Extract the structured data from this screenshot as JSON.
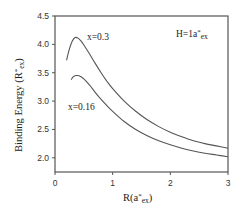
{
  "chart_data": {
    "type": "line",
    "title": "",
    "xlabel": {
      "base": "R(a",
      "sup": "*",
      "sub": "ex",
      "close": ")"
    },
    "ylabel": {
      "base": "Binding Energy (R",
      "sup": "*",
      "sub": "ex",
      "close": ")"
    },
    "xlim": [
      0,
      3
    ],
    "ylim": [
      1.75,
      4.5
    ],
    "xticks": [
      0,
      1,
      2,
      3
    ],
    "xtick_labels": [
      "0",
      "1",
      "2",
      "3"
    ],
    "yticks": [
      2.0,
      2.5,
      3.0,
      3.5,
      4.0,
      4.5
    ],
    "ytick_labels": [
      "2.0",
      "2.5",
      "3.0",
      "3.5",
      "4.0",
      "4.5"
    ],
    "grid": false,
    "legend": null,
    "annotations": [
      {
        "id": "x03",
        "text": "x=0.3"
      },
      {
        "id": "x016",
        "text": "x=0.16"
      },
      {
        "id": "H",
        "base": "H=1a",
        "sup": "*",
        "sub": "ex"
      }
    ],
    "series": [
      {
        "name": "x=0.3",
        "x": [
          0.2,
          0.25,
          0.3,
          0.35,
          0.4,
          0.45,
          0.5,
          0.6,
          0.7,
          0.8,
          0.9,
          1.0,
          1.2,
          1.4,
          1.6,
          1.8,
          2.0,
          2.2,
          2.4,
          2.6,
          2.8,
          3.0
        ],
        "values": [
          3.72,
          3.92,
          4.06,
          4.12,
          4.11,
          4.06,
          3.99,
          3.83,
          3.66,
          3.5,
          3.35,
          3.22,
          3.0,
          2.82,
          2.67,
          2.55,
          2.45,
          2.37,
          2.3,
          2.25,
          2.21,
          2.17
        ]
      },
      {
        "name": "x=0.16",
        "x": [
          0.28,
          0.32,
          0.36,
          0.4,
          0.45,
          0.5,
          0.6,
          0.7,
          0.8,
          0.9,
          1.0,
          1.2,
          1.4,
          1.6,
          1.8,
          2.0,
          2.2,
          2.4,
          2.6,
          2.8,
          3.0
        ],
        "values": [
          3.38,
          3.43,
          3.45,
          3.45,
          3.43,
          3.39,
          3.28,
          3.15,
          3.03,
          2.92,
          2.82,
          2.64,
          2.5,
          2.39,
          2.3,
          2.23,
          2.17,
          2.12,
          2.08,
          2.05,
          2.02
        ]
      }
    ]
  }
}
